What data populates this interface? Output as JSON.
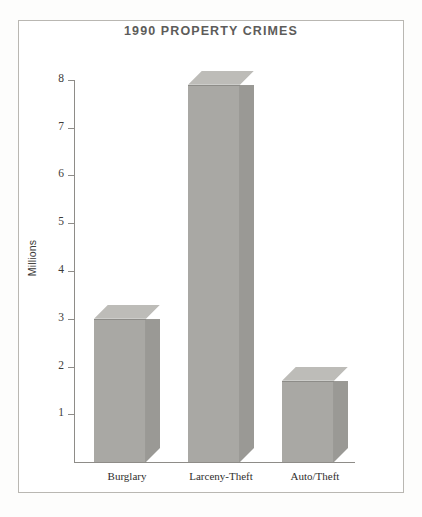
{
  "chart_data": {
    "type": "bar",
    "title": "1990 PROPERTY CRIMES",
    "xlabel": "",
    "ylabel": "Millions",
    "categories": [
      "Burglary",
      "Larceny-Theft",
      "Auto/Theft"
    ],
    "values": [
      3.0,
      7.9,
      1.7
    ],
    "ylim": [
      0,
      8.4
    ],
    "yticks": [
      1,
      2,
      3,
      4,
      5,
      6,
      7,
      8
    ],
    "ytick_labels": [
      "1",
      "2",
      "3",
      "4",
      "5",
      "6",
      "7",
      "8"
    ],
    "grid": false,
    "legend": null,
    "style": "3d-bars",
    "colors": {
      "bar_front": "#a9a8a4",
      "bar_top": "#bdbcb8",
      "bar_side": "#9a9995",
      "axis": "#8e8c88",
      "title_text": "#5d5c5a",
      "label_text": "#2f2e2d",
      "frame": "#b9b7b2",
      "background": "#ffffff"
    }
  },
  "axis": {
    "ticks": [
      {
        "label": "8"
      },
      {
        "label": "7"
      },
      {
        "label": "6"
      },
      {
        "label": "5"
      },
      {
        "label": "4"
      },
      {
        "label": "3"
      },
      {
        "label": "2"
      },
      {
        "label": "1"
      }
    ]
  }
}
